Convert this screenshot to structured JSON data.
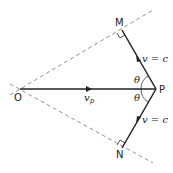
{
  "diagram": {
    "points": {
      "O": {
        "label": "O",
        "x": 20,
        "y": 89
      },
      "P": {
        "label": "P",
        "x": 156,
        "y": 89
      },
      "M": {
        "label": "M",
        "x": 122,
        "y": 30
      },
      "N": {
        "label": "N",
        "x": 122,
        "y": 148
      }
    },
    "labels": {
      "vp_main": "v",
      "vp_sub": "p",
      "upper_velocity": "v = c",
      "lower_velocity": "v = c",
      "theta_upper": "θ",
      "theta_lower": "θ"
    },
    "colors": {
      "line": "#222222",
      "dashed": "#777777",
      "background": "#ffffff"
    }
  }
}
